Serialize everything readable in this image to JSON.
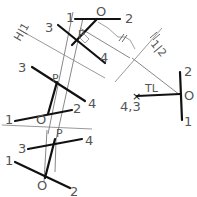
{
  "diagram": {
    "type": "descriptive-geometry-auxiliary-views",
    "top_view": {
      "line_12": {
        "end1": "1",
        "end2": "2",
        "point": "O"
      },
      "line_34": {
        "end1": "3",
        "end2": "4",
        "point": "P"
      }
    },
    "fold_line_h1": {
      "label": "H|1",
      "marks": "H|1"
    },
    "fold_line_12": {
      "label": "1|2",
      "marks": "//"
    },
    "aux_view_1": {
      "line_34": {
        "end1": "3",
        "end2": "4",
        "point": "P"
      },
      "line_12": {
        "end1": "1",
        "end2": "2",
        "point": "O"
      }
    },
    "front_view": {
      "line_34": {
        "end1": "3",
        "end2": "4",
        "point": "P"
      },
      "line_12": {
        "end1": "1",
        "end2": "2",
        "point": "O"
      }
    },
    "aux_view_2": {
      "line_12_point_view": {
        "end1": "2",
        "end2": "1",
        "point": "O"
      },
      "line_34_point_view": {
        "label": "4,3"
      },
      "true_length_label": "TL"
    },
    "labels": {
      "one": "1",
      "two": "2",
      "three": "3",
      "four": "4",
      "O": "O",
      "P": "P",
      "TL": "TL",
      "point43": "4,3",
      "H1": "H|1",
      "one_two": "1|2"
    }
  }
}
